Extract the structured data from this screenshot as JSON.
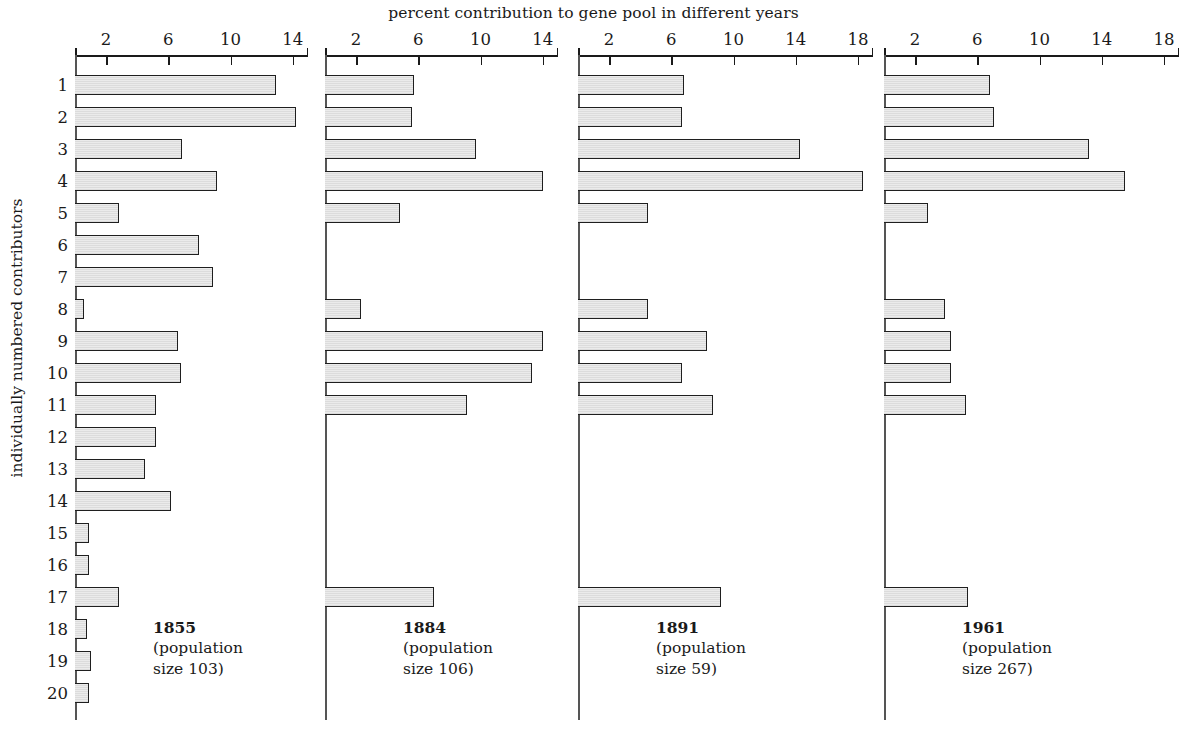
{
  "chart_data": {
    "type": "bar",
    "orientation": "horizontal",
    "title": "percent contribution to gene pool in different years",
    "xlabel": "",
    "ylabel": "individually numbered contributors",
    "grid": false,
    "legend": "none",
    "categories": [
      "1",
      "2",
      "3",
      "4",
      "5",
      "6",
      "7",
      "8",
      "9",
      "10",
      "11",
      "12",
      "13",
      "14",
      "15",
      "16",
      "17",
      "18",
      "19",
      "20"
    ],
    "panels": [
      {
        "year": "1855",
        "population_line1": "(population",
        "population_line2": "size 103)",
        "population_size": 103,
        "xlim": [
          0,
          15.0
        ],
        "xticks": [
          2,
          6,
          10,
          14
        ],
        "xtick_labels": [
          "2",
          "6",
          "10",
          "14"
        ],
        "values": [
          12.9,
          14.2,
          6.9,
          9.1,
          2.8,
          8.0,
          8.9,
          0.6,
          6.6,
          6.8,
          5.2,
          5.2,
          4.5,
          6.2,
          0.9,
          0.9,
          2.8,
          0.8,
          1.0,
          0.9
        ]
      },
      {
        "year": "1884",
        "population_line1": "(population",
        "population_line2": "size 106)",
        "population_size": 106,
        "xlim": [
          0,
          15.0
        ],
        "xticks": [
          2,
          6,
          10,
          14
        ],
        "xtick_labels": [
          "2",
          "6",
          "10",
          "14"
        ],
        "values": [
          5.7,
          5.6,
          9.7,
          14.0,
          4.8,
          0,
          0,
          2.3,
          14.0,
          13.3,
          9.1,
          0,
          0,
          0,
          0,
          0,
          7.0,
          0,
          0,
          0
        ]
      },
      {
        "year": "1891",
        "population_line1": "(population",
        "population_line2": "size 59)",
        "population_size": 59,
        "xlim": [
          0,
          19.0
        ],
        "xticks": [
          2,
          6,
          10,
          14,
          18
        ],
        "xtick_labels": [
          "2",
          "6",
          "10",
          "14",
          "18"
        ],
        "values": [
          6.8,
          6.7,
          14.3,
          18.3,
          4.5,
          0,
          0,
          4.5,
          8.3,
          6.7,
          8.7,
          0,
          0,
          0,
          0,
          0,
          9.2,
          0,
          0,
          0
        ]
      },
      {
        "year": "1961",
        "population_line1": "(population",
        "population_line2": "size 267)",
        "population_size": 267,
        "xlim": [
          0,
          19.0
        ],
        "xticks": [
          2,
          6,
          10,
          14,
          18
        ],
        "xtick_labels": [
          "2",
          "6",
          "10",
          "14",
          "18"
        ],
        "values": [
          6.8,
          7.1,
          13.2,
          15.5,
          2.8,
          0,
          0,
          3.9,
          4.3,
          4.3,
          5.3,
          0,
          0,
          0,
          0,
          0,
          5.4,
          0,
          0,
          0
        ]
      }
    ]
  },
  "style": {
    "bar_fill": "#e6e6e6",
    "bar_stroke": "#1f1f1f",
    "axis_color": "#1a1a1a",
    "text_color": "#1a1a1a",
    "background": "#ffffff"
  }
}
